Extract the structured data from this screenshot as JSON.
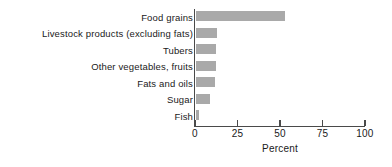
{
  "chart_data": {
    "type": "bar",
    "orientation": "horizontal",
    "title": "",
    "xlabel": "Percent",
    "ylabel": "",
    "xlim": [
      0,
      100
    ],
    "xticks": [
      0,
      25,
      50,
      75,
      100
    ],
    "xtick_labels": [
      "0",
      "25",
      "50",
      "75",
      "100"
    ],
    "grid": false,
    "legend": null,
    "bar_color": "#a9a9a9",
    "axis_color": "#4a4a4a",
    "text_color": "#1a1a1a",
    "categories": [
      "Food grains",
      "Livestock products (excluding fats)",
      "Tubers",
      "Other vegetables, fruits",
      "Fats and oils",
      "Sugar",
      "Fish"
    ],
    "values": [
      52.4,
      12.4,
      11.8,
      11.8,
      11.2,
      8.2,
      1.8
    ]
  }
}
